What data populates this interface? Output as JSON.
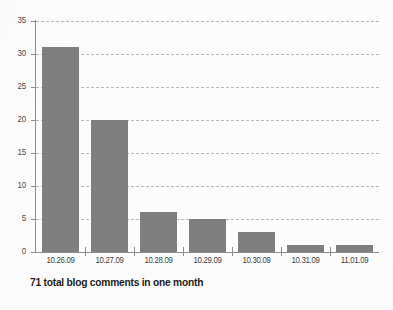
{
  "chart_data": {
    "type": "bar",
    "title": "",
    "subtitle": "",
    "xlabel": "",
    "ylabel": "",
    "categories": [
      "10.26.09",
      "10.27.09",
      "10.28.09",
      "10.29.09",
      "10.30.09",
      "10.31.09",
      "11.01.09"
    ],
    "values": [
      31,
      20,
      6,
      5,
      3,
      1,
      1
    ],
    "ylim": [
      0,
      35
    ],
    "yticks": [
      0,
      5,
      10,
      15,
      20,
      25,
      30,
      35
    ],
    "ytick_labels": [
      "0",
      "5",
      "10",
      "15",
      "20",
      "25",
      "30",
      "35"
    ],
    "grid": true,
    "grid_style": "dashed",
    "legend": false,
    "bar_color": "#7f7f7f",
    "grid_color": "#b9b9b9",
    "axis_color": "#8d8d8d",
    "background_color": "#fcfcfc",
    "annotations": [
      "71 total blog comments in one month"
    ]
  },
  "caption": {
    "text": "71 total blog comments in one month"
  }
}
